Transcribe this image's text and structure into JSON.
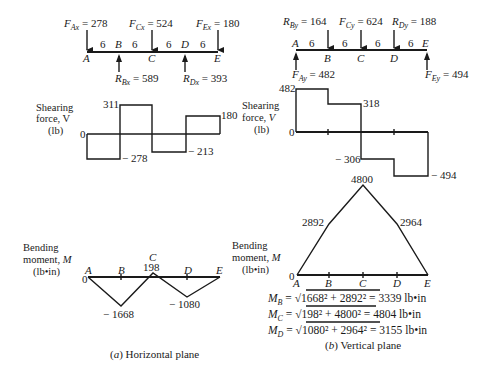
{
  "horizontal_plane": {
    "caption": "(a) Horizontal plane",
    "caption_letter": "a",
    "caption_text": "Horizontal plane",
    "points": [
      "A",
      "B",
      "C",
      "D",
      "E"
    ],
    "spans": [
      "6",
      "6",
      "6",
      "6"
    ],
    "loads": {
      "FAx": {
        "sym": "F",
        "sub": "Ax",
        "value": "278",
        "direction": "down",
        "at": "A"
      },
      "FCx": {
        "sym": "F",
        "sub": "Cx",
        "value": "524",
        "direction": "down",
        "at": "C"
      },
      "FEx": {
        "sym": "F",
        "sub": "Ex",
        "value": "180",
        "direction": "down",
        "at": "E"
      },
      "RBx": {
        "sym": "R",
        "sub": "Bx",
        "value": "589",
        "direction": "up",
        "at": "B"
      },
      "RDx": {
        "sym": "R",
        "sub": "Dx",
        "value": "393",
        "direction": "up",
        "at": "D"
      }
    },
    "shear": {
      "label_line1": "Shearing",
      "label_line2": "force, V",
      "label_line3": "(lb)",
      "zero": "0",
      "values": [
        "-278",
        "311",
        "-213",
        "180"
      ],
      "labels": {
        "v1": "− 278",
        "v2": "311",
        "v3": "− 213",
        "v4": "180"
      }
    },
    "moment": {
      "label_line1": "Bending",
      "label_line2": "moment, M",
      "label_line3": "(lb•in)",
      "zero": "0",
      "values": {
        "A": "0",
        "B": "-1668",
        "C": "198",
        "D": "-1080",
        "E": "0"
      },
      "labels": {
        "B": "− 1668",
        "C": "198",
        "D": "− 1080"
      }
    }
  },
  "vertical_plane": {
    "caption": "(b) Vertical plane",
    "caption_letter": "b",
    "caption_text": "Vertical plane",
    "points": [
      "A",
      "B",
      "C",
      "D",
      "E"
    ],
    "spans": [
      "6",
      "6",
      "6",
      "6"
    ],
    "loads": {
      "RBy": {
        "sym": "R",
        "sub": "By",
        "value": "164",
        "direction": "down",
        "at": "B"
      },
      "FCy": {
        "sym": "F",
        "sub": "Cy",
        "value": "624",
        "direction": "down",
        "at": "C"
      },
      "RDy": {
        "sym": "R",
        "sub": "Dy",
        "value": "188",
        "direction": "down",
        "at": "D"
      },
      "FAy": {
        "sym": "F",
        "sub": "Ay",
        "value": "482",
        "direction": "up",
        "at": "A"
      },
      "FEy": {
        "sym": "F",
        "sub": "Ey",
        "value": "494",
        "direction": "up",
        "at": "E"
      }
    },
    "shear": {
      "label_line1": "Shearing",
      "label_line2": "force, V",
      "label_line3": "(lb)",
      "zero": "0",
      "values": [
        "482",
        "318",
        "-306",
        "-494"
      ],
      "labels": {
        "v1": "482",
        "v2": "318",
        "v3": "− 306",
        "v4": "− 494"
      }
    },
    "moment": {
      "label_line1": "Bending",
      "label_line2": "moment, M",
      "label_line3": "(lb•in)",
      "zero": "0",
      "values": {
        "A": "0",
        "B": "2892",
        "C": "4800",
        "D": "2964",
        "E": "0"
      },
      "labels": {
        "B": "2892",
        "C": "4800",
        "D": "2964"
      }
    }
  },
  "resultants": [
    {
      "sym": "M",
      "sub": "B",
      "radicand": "1668² + 2892²",
      "result": "= 3339 lb•in"
    },
    {
      "sym": "M",
      "sub": "C",
      "radicand": "198² + 4800²",
      "result": "= 4804 lb•in"
    },
    {
      "sym": "M",
      "sub": "D",
      "radicand": "1080² + 2964²",
      "result": "= 3155 lb•in"
    }
  ]
}
